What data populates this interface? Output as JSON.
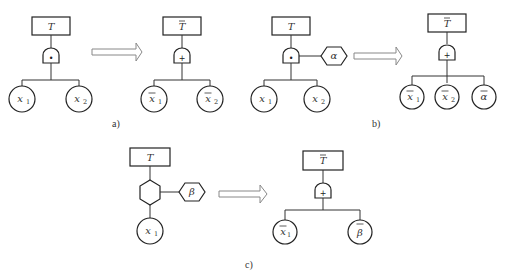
{
  "figure": {
    "panels": [
      {
        "id": "a",
        "caption": "a)",
        "before": {
          "top_event": "T",
          "gate": {
            "type": "AND",
            "symbol": "•"
          },
          "children": [
            {
              "var": "x",
              "sub": "1",
              "negated": false
            },
            {
              "var": "x",
              "sub": "2",
              "negated": false
            }
          ]
        },
        "after": {
          "top_event": "T",
          "top_negated": true,
          "gate": {
            "type": "OR",
            "symbol": "+"
          },
          "children": [
            {
              "var": "x",
              "sub": "1",
              "negated": true
            },
            {
              "var": "x",
              "sub": "2",
              "negated": true
            }
          ]
        }
      },
      {
        "id": "b",
        "caption": "b)",
        "before": {
          "top_event": "T",
          "gate": {
            "type": "AND",
            "symbol": "•"
          },
          "condition": {
            "shape": "hexagon",
            "label": "α"
          },
          "children": [
            {
              "var": "x",
              "sub": "1",
              "negated": false
            },
            {
              "var": "x",
              "sub": "2",
              "negated": false
            }
          ]
        },
        "after": {
          "top_event": "T",
          "top_negated": true,
          "gate": {
            "type": "OR",
            "symbol": "+"
          },
          "children": [
            {
              "var": "x",
              "sub": "1",
              "negated": true
            },
            {
              "var": "x",
              "sub": "2",
              "negated": true
            },
            {
              "var": "α",
              "sub": "",
              "negated": true
            }
          ]
        }
      },
      {
        "id": "c",
        "caption": "c)",
        "before": {
          "top_event": "T",
          "gate": {
            "type": "INHIBIT",
            "shape": "hexagon"
          },
          "condition": {
            "shape": "hexagon",
            "label": "β"
          },
          "children": [
            {
              "var": "x",
              "sub": "1",
              "negated": false
            }
          ]
        },
        "after": {
          "top_event": "T",
          "top_negated": true,
          "gate": {
            "type": "OR",
            "symbol": "+"
          },
          "children": [
            {
              "var": "x",
              "sub": "1",
              "negated": true
            },
            {
              "var": "β",
              "sub": "",
              "negated": true
            }
          ]
        }
      }
    ],
    "arrow_icon": "hollow-right-arrow"
  }
}
